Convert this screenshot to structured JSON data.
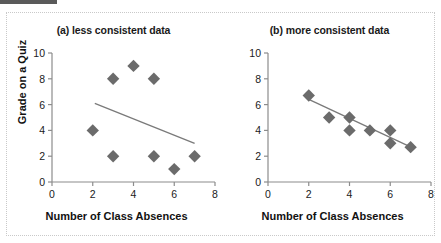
{
  "figure": {
    "xlabel": "Number of Class Absences",
    "ylabel": "Grade on a Quiz",
    "marker_color": "#6b6b6b",
    "line_color": "#7a7a7a",
    "axis_color": "#8c8c8c",
    "text_color": "#1a1a1a",
    "frame_color": "#c9c9c9"
  },
  "panel_a": {
    "title": "(a) less consistent data",
    "xlabel": "Number of Class Absences",
    "ylabel": "Grade on a Quiz",
    "xticks": [
      "0",
      "2",
      "4",
      "6",
      "8"
    ],
    "yticks": [
      "0",
      "2",
      "4",
      "6",
      "8",
      "10"
    ]
  },
  "panel_b": {
    "title": "(b) more consistent data",
    "xlabel": "Number of Class Absences",
    "ylabel": "",
    "xticks": [
      "0",
      "2",
      "4",
      "6",
      "8"
    ],
    "yticks": [
      "0",
      "2",
      "4",
      "6",
      "8",
      "10"
    ]
  },
  "chart_data": [
    {
      "type": "scatter",
      "title": "(a) less consistent data",
      "xlabel": "Number of Class Absences",
      "ylabel": "Grade on a Quiz",
      "xlim": [
        0,
        8
      ],
      "ylim": [
        0,
        10
      ],
      "xticks": [
        0,
        2,
        4,
        6,
        8
      ],
      "yticks": [
        0,
        2,
        4,
        6,
        8,
        10
      ],
      "grid": false,
      "legend": "none",
      "marker": "diamond",
      "points": [
        {
          "x": 2,
          "y": 4
        },
        {
          "x": 3,
          "y": 8
        },
        {
          "x": 3,
          "y": 2
        },
        {
          "x": 4,
          "y": 9
        },
        {
          "x": 5,
          "y": 8
        },
        {
          "x": 5,
          "y": 2
        },
        {
          "x": 6,
          "y": 1
        },
        {
          "x": 7,
          "y": 2
        }
      ],
      "trendline": {
        "x0": 2.1,
        "y0": 6.1,
        "x1": 7.0,
        "y1": 3.0
      }
    },
    {
      "type": "scatter",
      "title": "(b) more consistent data",
      "xlabel": "Number of Class Absences",
      "ylabel": "",
      "xlim": [
        0,
        8
      ],
      "ylim": [
        0,
        10
      ],
      "xticks": [
        0,
        2,
        4,
        6,
        8
      ],
      "yticks": [
        0,
        2,
        4,
        6,
        8,
        10
      ],
      "grid": false,
      "legend": "none",
      "marker": "diamond",
      "points": [
        {
          "x": 2,
          "y": 6.7
        },
        {
          "x": 3,
          "y": 5.0
        },
        {
          "x": 4,
          "y": 5.0
        },
        {
          "x": 4,
          "y": 4.0
        },
        {
          "x": 5,
          "y": 4.0
        },
        {
          "x": 6,
          "y": 4.0
        },
        {
          "x": 6,
          "y": 3.0
        },
        {
          "x": 7,
          "y": 2.7
        }
      ],
      "trendline": {
        "x0": 2.0,
        "y0": 6.4,
        "x1": 7.15,
        "y1": 2.6
      }
    }
  ]
}
